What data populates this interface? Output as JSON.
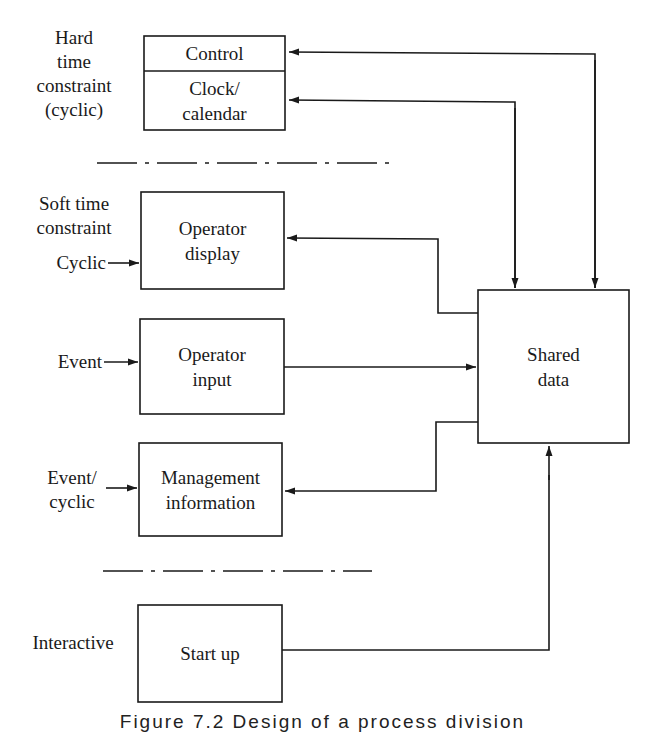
{
  "diagram": {
    "type": "block-diagram",
    "colors": {
      "ink": "#1a1a1a",
      "background": "#ffffff"
    },
    "groups": [
      {
        "id": "hard",
        "label": "Hard\ntime\nconstraint\n(cyclic)"
      },
      {
        "id": "soft",
        "label": "Soft time\nconstraint"
      },
      {
        "id": "interactive",
        "label": "Interactive"
      }
    ],
    "inputs": [
      {
        "id": "cyclic",
        "label": "Cyclic",
        "target": "operator_display"
      },
      {
        "id": "event",
        "label": "Event",
        "target": "operator_input"
      },
      {
        "id": "event_cyclic",
        "label": "Event/\ncyclic",
        "target": "management_information"
      }
    ],
    "boxes": [
      {
        "id": "control",
        "label": "Control"
      },
      {
        "id": "clock_calendar",
        "label": "Clock/\ncalendar"
      },
      {
        "id": "operator_display",
        "label": "Operator\ndisplay"
      },
      {
        "id": "operator_input",
        "label": "Operator\ninput"
      },
      {
        "id": "management_information",
        "label": "Management\ninformation"
      },
      {
        "id": "start_up",
        "label": "Start up"
      },
      {
        "id": "shared_data",
        "label": "Shared\ndata"
      }
    ],
    "edges": [
      {
        "from": "control",
        "to": "shared_data",
        "direction": "bidirectional"
      },
      {
        "from": "clock_calendar",
        "to": "shared_data",
        "direction": "bidirectional"
      },
      {
        "from": "shared_data",
        "to": "operator_display",
        "direction": "forward"
      },
      {
        "from": "operator_input",
        "to": "shared_data",
        "direction": "forward"
      },
      {
        "from": "shared_data",
        "to": "management_information",
        "direction": "forward"
      },
      {
        "from": "start_up",
        "to": "shared_data",
        "direction": "forward"
      }
    ],
    "separators": 2
  },
  "caption": "Figure 7.2  Design of a process division"
}
